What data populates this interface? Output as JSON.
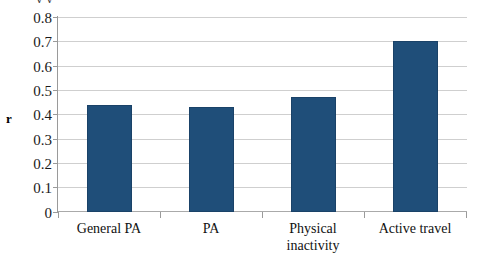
{
  "chart_data": {
    "type": "bar",
    "title": "",
    "cropped_title_remnant": "y   y",
    "categories": [
      "General PA",
      "PA",
      "Physical inactivity",
      "Active travel"
    ],
    "category_lines": [
      [
        "General PA"
      ],
      [
        "PA"
      ],
      [
        "Physical",
        "inactivity"
      ],
      [
        "Active travel"
      ]
    ],
    "values": [
      0.44,
      0.43,
      0.47,
      0.7
    ],
    "xlabel": "",
    "ylabel": "r",
    "ylim": [
      0,
      0.8
    ],
    "ytick_step": 0.1,
    "ytick_labels": [
      "0.8",
      "0.7",
      "0.6",
      "0.5",
      "0.4",
      "0.3",
      "0.2",
      "0.1",
      "0"
    ],
    "ytick_values": [
      0.8,
      0.7,
      0.6,
      0.5,
      0.4,
      0.3,
      0.2,
      0.1,
      0
    ],
    "grid": true,
    "grid_axis": "y",
    "legend": false,
    "legend_position": "none",
    "series": [
      {
        "name": "r",
        "values": [
          0.44,
          0.43,
          0.47,
          0.7
        ]
      }
    ],
    "colors": {
      "bar": "#1f4e79",
      "bar_border": "#1a4268",
      "gridline": "#cfcfcf",
      "axis": "#9a9a9a",
      "background": "#ffffff",
      "text": "#111111"
    }
  }
}
